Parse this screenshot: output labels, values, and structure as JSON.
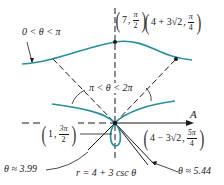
{
  "diagram": {
    "equation": "r = 4 + 3 csc θ",
    "axis_label": "A",
    "colors": {
      "curve": "#2a8f98",
      "lines": "#1a1a1a",
      "background": "#ffffff"
    },
    "region_labels": {
      "upper_branch": "0 < θ < π",
      "lower_branch": "π < θ < 2π"
    },
    "points": [
      {
        "id": "p1",
        "r": "7",
        "theta_num": "π",
        "theta_den": "2",
        "display": "(7, π/2)"
      },
      {
        "id": "p2",
        "r": "4 + 3√2",
        "theta_num": "π",
        "theta_den": "4",
        "display": "(4 + 3√2, π/4)"
      },
      {
        "id": "p3",
        "r": "1",
        "theta_num": "3π",
        "theta_den": "2",
        "display": "(1, 3π/2)"
      },
      {
        "id": "p4",
        "r": "4 − 3√2",
        "theta_num": "5π",
        "theta_den": "4",
        "display": "(4 − 3√2, 5π/4)"
      }
    ],
    "angle_labels": {
      "left": "θ ≈ 3.99",
      "right": "θ ≈ 5.44"
    }
  }
}
